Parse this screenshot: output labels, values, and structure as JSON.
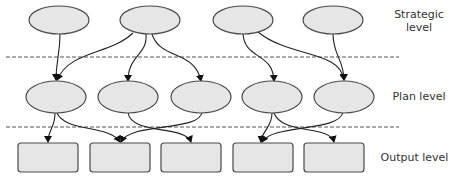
{
  "labels": {
    "strategic": "Strategic\nlevel",
    "strategic_line1": "Strategic",
    "strategic_line2": "level",
    "plan": "Plan level",
    "output": "Output level"
  },
  "colors": {
    "node_fill": "#e6e6e6",
    "node_stroke": "#4a4a4a",
    "edge": "#222222"
  },
  "levels": {
    "strategic": {
      "nodes": 4
    },
    "plan": {
      "nodes": 5
    },
    "output": {
      "nodes": 5
    }
  },
  "edges": [
    [
      "S1",
      "P1"
    ],
    [
      "S2",
      "P1"
    ],
    [
      "S2",
      "P2"
    ],
    [
      "S2",
      "P3"
    ],
    [
      "S3",
      "P4"
    ],
    [
      "S3",
      "P5"
    ],
    [
      "S4",
      "P5"
    ],
    [
      "P1",
      "O1"
    ],
    [
      "P1",
      "O2"
    ],
    [
      "P2",
      "O3"
    ],
    [
      "P3",
      "O2"
    ],
    [
      "P4",
      "O4"
    ],
    [
      "P4",
      "O5"
    ],
    [
      "P5",
      "O4"
    ]
  ]
}
